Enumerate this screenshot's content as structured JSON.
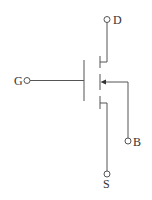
{
  "diagram": {
    "terminals": {
      "drain": "D",
      "gate": "G",
      "body": "B",
      "source": "S"
    },
    "colors": {
      "line": "#555555",
      "text": "#333333",
      "background": "#ffffff"
    }
  }
}
